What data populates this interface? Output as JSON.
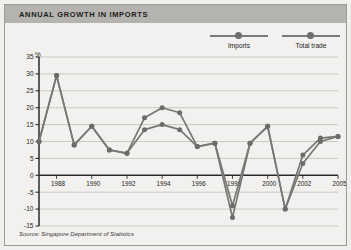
{
  "figure": {
    "title": "ANNUAL GROWTH IN IMPORTS",
    "source": "Source: Singapore Department of Statistics",
    "title_band_color": "#b4b3af",
    "panel_color": "#f2f1ef",
    "series_color": "#777775",
    "marker_color": "#6b6b69"
  },
  "legend": {
    "position": "top-right",
    "items": [
      {
        "label": "Imports",
        "symbol": "line-with-dot"
      },
      {
        "label": "Total trade",
        "symbol": "line-with-dot"
      }
    ]
  },
  "chart_data": {
    "type": "line",
    "title": "ANNUAL GROWTH IN IMPORTS",
    "xlabel": "",
    "ylabel": "%",
    "ylim": [
      -15,
      35
    ],
    "yticks": [
      -15,
      -10,
      -5,
      0,
      5,
      10,
      15,
      20,
      25,
      30,
      35
    ],
    "ytick_labels": [
      "-15",
      "-10",
      "-5",
      "0",
      "5",
      "10",
      "15",
      "20",
      "25",
      "30",
      "35"
    ],
    "xlim": [
      1987,
      2004
    ],
    "x": [
      1987,
      1988,
      1989,
      1990,
      1991,
      1992,
      1993,
      1994,
      1995,
      1996,
      1997,
      1998,
      1999,
      2000,
      2001,
      2002,
      2003,
      2004
    ],
    "xtick_positions": [
      1988,
      1990,
      1992,
      1994,
      1996,
      1998,
      2000,
      2002,
      2004
    ],
    "xtick_labels": [
      "1988",
      "1990",
      "1992",
      "1994",
      "1996",
      "1998",
      "2000",
      "2002",
      "2005"
    ],
    "grid": true,
    "gridlines": "horizontal",
    "legend_position": "top-right",
    "series": [
      {
        "name": "Imports",
        "values": [
          10,
          29.5,
          9,
          14.5,
          7.5,
          6.5,
          17,
          20,
          18.5,
          8.5,
          9.5,
          -12.5,
          9.5,
          14.5,
          -10,
          3.5,
          10,
          11.5
        ]
      },
      {
        "name": "Total trade",
        "values": [
          10,
          29.5,
          9,
          14.5,
          7.5,
          6.5,
          13.5,
          15,
          13.5,
          8.5,
          9.5,
          -9,
          9.5,
          14.5,
          -10,
          6,
          11,
          11.5
        ]
      }
    ]
  }
}
